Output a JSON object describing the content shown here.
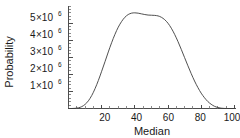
{
  "chart_data": {
    "type": "line",
    "title": "",
    "subtitle": "",
    "xlabel": "Median",
    "ylabel": "Probability",
    "xlim": [
      0,
      101
    ],
    "ylim": [
      0,
      6000000
    ],
    "grid": false,
    "legend": null,
    "x_ticks": [
      20,
      40,
      60,
      80,
      100
    ],
    "x_tick_labels": [
      "20",
      "40",
      "60",
      "80",
      "100"
    ],
    "x_minor_tick_step": 5,
    "y_ticks": [
      1000000,
      2000000,
      3000000,
      4000000,
      5000000
    ],
    "y_tick_labels": [
      "1×10⁶",
      "2×10⁶",
      "3×10⁶",
      "4×10⁶",
      "5×10⁶"
    ],
    "y_tick_mantissas": [
      "1",
      "2",
      "3",
      "4",
      "5"
    ],
    "y_tick_base": "×10",
    "y_tick_exponent": "6",
    "y_minor_tick_step": 200000,
    "series": [
      {
        "name": "probability-density",
        "peak_x": 50,
        "peak_y": 5600000,
        "x": [
          0,
          2,
          4,
          6,
          8,
          10,
          12,
          14,
          16,
          18,
          20,
          22,
          24,
          26,
          28,
          30,
          32,
          34,
          36,
          38,
          40,
          42,
          44,
          46,
          48,
          50,
          52,
          54,
          56,
          58,
          60,
          62,
          64,
          66,
          68,
          70,
          72,
          74,
          76,
          78,
          80,
          82,
          84,
          86,
          88,
          90,
          92,
          94,
          96,
          98,
          100
        ],
        "y": [
          0,
          0,
          10000,
          40000,
          110000,
          240000,
          450000,
          760000,
          1160000,
          1640000,
          2180000,
          2740000,
          3310000,
          3850000,
          4340000,
          4760000,
          5090000,
          5340000,
          5500000,
          5580000,
          5600000,
          5580000,
          5540000,
          5500000,
          5470000,
          5460000,
          5450000,
          5420000,
          5340000,
          5200000,
          4990000,
          4700000,
          4340000,
          3920000,
          3460000,
          2980000,
          2500000,
          2040000,
          1610000,
          1230000,
          900000,
          630000,
          410000,
          250000,
          130000,
          60000,
          20000,
          4000,
          0,
          0,
          0
        ]
      }
    ]
  },
  "axis_titles": {
    "x": "Median",
    "y": "Probability"
  },
  "figure": {
    "background_color": "#ffffff",
    "curve_color": "#3c3c3c",
    "axis_color": "#4d4d4d",
    "text_color": "#1a1a1a"
  }
}
